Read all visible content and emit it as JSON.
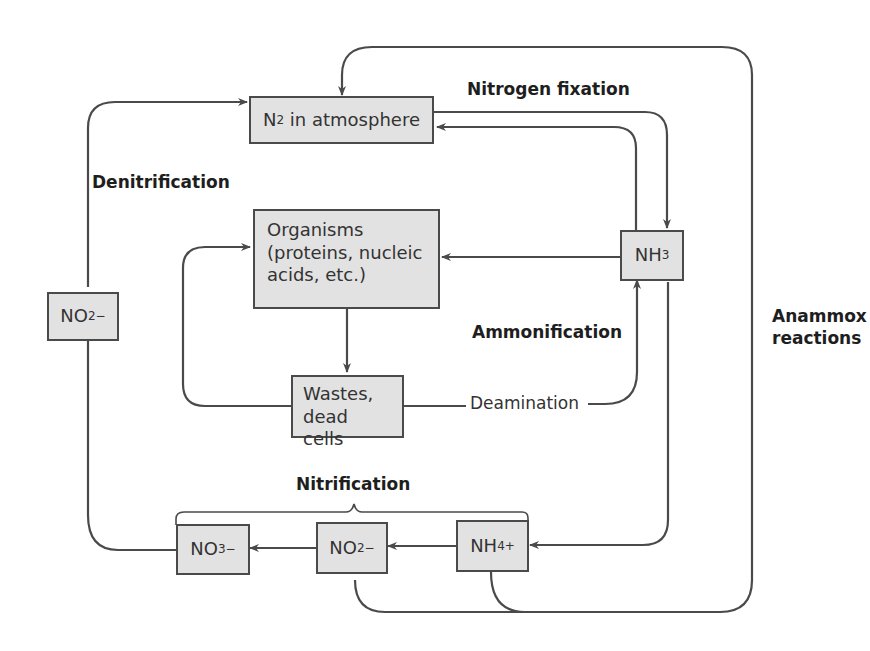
{
  "diagram": {
    "type": "nitrogen-cycle",
    "colors": {
      "box_fill": "#e2e2e2",
      "box_border": "#4a4a4a",
      "line": "#4a4a4a",
      "text": "#333333"
    },
    "nodes": {
      "n2": {
        "main": "N",
        "sub": "2",
        "rest": " in atmosphere"
      },
      "organisms": {
        "line1": "Organisms",
        "line2": "(proteins, nucleic",
        "line3": "acids, etc.)"
      },
      "nh3": {
        "main": "NH",
        "sub": "3"
      },
      "wastes": {
        "line1": "Wastes,",
        "line2": "dead cells"
      },
      "no2_left": {
        "main": "NO",
        "sub": "2",
        "sup": "−"
      },
      "no3": {
        "main": "NO",
        "sub": "3",
        "sup": "−"
      },
      "no2_bottom": {
        "main": "NO",
        "sub": "2",
        "sup": "−"
      },
      "nh4": {
        "main": "NH",
        "sub": "4",
        "sup": "+"
      }
    },
    "labels": {
      "nitrogen_fixation": "Nitrogen fixation",
      "denitrification": "Denitrification",
      "ammonification": "Ammonification",
      "deamination": "Deamination",
      "nitrification": "Nitrification",
      "anammox_line1": "Anammox",
      "anammox_line2": "reactions"
    }
  }
}
